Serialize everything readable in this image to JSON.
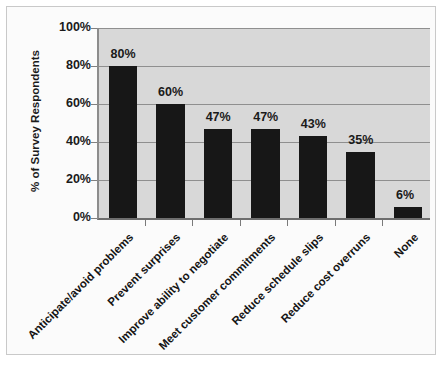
{
  "chart_data": {
    "type": "bar",
    "title": "",
    "subtitle": "",
    "xlabel": "",
    "ylabel": "% of Survey Respondents",
    "ylim": [
      0,
      100
    ],
    "grid": true,
    "legend": false,
    "legend_position": "none",
    "value_suffix": "%",
    "categories": [
      "Anticipate/avoid problems",
      "Prevent surprises",
      "Improve ability to negotiate",
      "Meet customer commitments",
      "Reduce schedule slips",
      "Reduce cost overruns",
      "None"
    ],
    "values": [
      80,
      60,
      47,
      47,
      43,
      35,
      6
    ],
    "data_labels": [
      "80%",
      "60%",
      "47%",
      "47%",
      "43%",
      "35%",
      "6%"
    ],
    "y_ticks": [
      0,
      20,
      40,
      60,
      80,
      100
    ],
    "y_tick_labels": [
      "0%",
      "20%",
      "40%",
      "60%",
      "80%",
      "100%"
    ],
    "colors": {
      "bar": "#171717",
      "plot_background": "#d8d8d8",
      "figure_background": "#fbfbfb",
      "gridline": "#8f8f8f",
      "axis": "#6e6e6e",
      "text": "#1a1a1a"
    }
  }
}
